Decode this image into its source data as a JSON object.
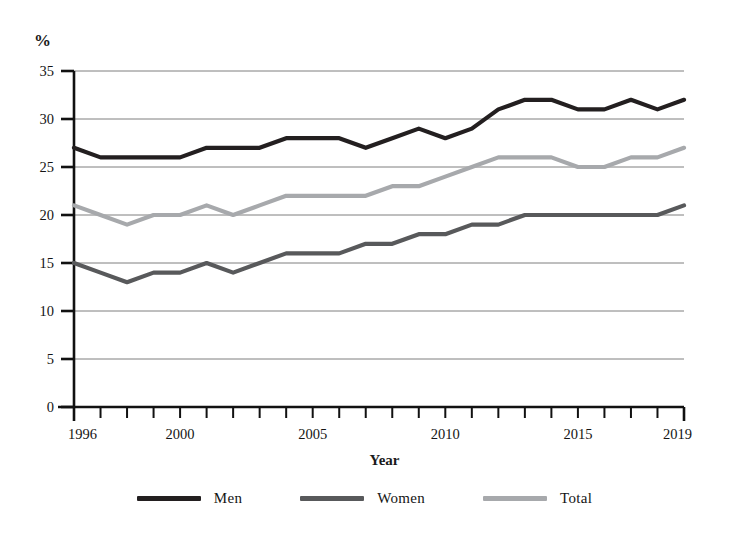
{
  "chart_data": {
    "type": "line",
    "title": "",
    "subtitle": "",
    "xlabel": "Year",
    "ylabel": "%",
    "unit_label": "%",
    "x": [
      1996,
      1997,
      1998,
      1999,
      2000,
      2001,
      2002,
      2003,
      2004,
      2005,
      2006,
      2007,
      2008,
      2009,
      2010,
      2011,
      2012,
      2013,
      2014,
      2015,
      2016,
      2017,
      2018,
      2019
    ],
    "xlim": [
      1996,
      2019
    ],
    "ylim": [
      0,
      35
    ],
    "y_ticks": [
      0,
      5,
      10,
      15,
      20,
      25,
      30,
      35
    ],
    "x_tick_labels": [
      {
        "value": 1996,
        "label": "1996"
      },
      {
        "value": 2000,
        "label": "2000"
      },
      {
        "value": 2005,
        "label": "2005"
      },
      {
        "value": 2010,
        "label": "2010"
      },
      {
        "value": 2015,
        "label": "2015"
      },
      {
        "value": 2019,
        "label": "2019"
      }
    ],
    "grid": "horizontal",
    "legend_position": "bottom",
    "series": [
      {
        "name": "Men",
        "color": "#231f20",
        "values": [
          27,
          26,
          26,
          26,
          26,
          27,
          27,
          27,
          28,
          28,
          28,
          27,
          28,
          29,
          28,
          29,
          31,
          32,
          32,
          31,
          31,
          32,
          31,
          32
        ]
      },
      {
        "name": "Women",
        "color": "#58595b",
        "values": [
          15,
          14,
          13,
          14,
          14,
          15,
          14,
          15,
          16,
          16,
          16,
          17,
          17,
          18,
          18,
          19,
          19,
          20,
          20,
          20,
          20,
          20,
          20,
          21
        ]
      },
      {
        "name": "Total",
        "color": "#a7a9ac",
        "values": [
          21,
          20,
          19,
          20,
          20,
          21,
          20,
          21,
          22,
          22,
          22,
          22,
          23,
          23,
          24,
          25,
          26,
          26,
          26,
          25,
          25,
          26,
          26,
          27
        ]
      }
    ]
  },
  "legend": {
    "entries": [
      {
        "label": "Men",
        "color": "#231f20"
      },
      {
        "label": "Women",
        "color": "#58595b"
      },
      {
        "label": "Total",
        "color": "#a7a9ac"
      }
    ]
  }
}
